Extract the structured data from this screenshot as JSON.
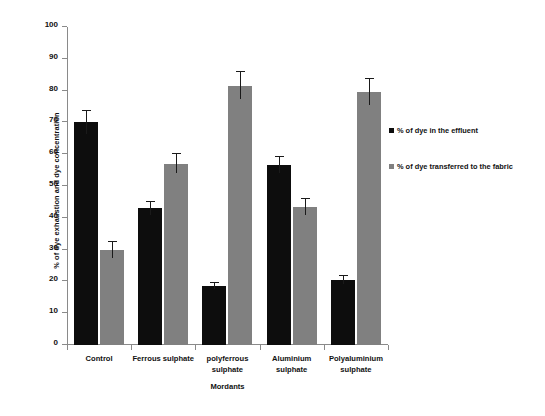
{
  "chart_data": {
    "type": "bar",
    "title": "",
    "xlabel": "Mordants",
    "ylabel": "% of dye exhaustion and dye concentration",
    "ylim": [
      0,
      100
    ],
    "ytick_step": 10,
    "yticks": [
      "100",
      "90",
      "80",
      "70",
      "60",
      "50",
      "40",
      "30",
      "20",
      "10",
      "0"
    ],
    "grid": false,
    "legend_position": "right",
    "categories": [
      "Control",
      "Ferrous sulphate",
      "polyferrous sulphate",
      "Aluminium sulphate",
      "Polyaluminium sulphate"
    ],
    "category_lines": [
      [
        "Control"
      ],
      [
        "Ferrous sulphate"
      ],
      [
        "polyferrous",
        "sulphate"
      ],
      [
        "Aluminium",
        "sulphate"
      ],
      [
        "Polyaluminium",
        "sulphate"
      ]
    ],
    "series": [
      {
        "name": "% of dye in the effluent",
        "color": "#0d0d0d",
        "values": [
          70.0,
          43.0,
          18.5,
          56.5,
          20.5
        ],
        "errors": [
          3.5,
          2.0,
          1.0,
          2.5,
          1.3
        ]
      },
      {
        "name": "% of dye transferred to the fabric",
        "color": "#808080",
        "values": [
          30.0,
          57.0,
          81.5,
          43.5,
          79.5
        ],
        "errors": [
          2.5,
          3.0,
          4.2,
          2.5,
          4.0
        ]
      }
    ]
  },
  "legend": {
    "items": [
      {
        "label": "% of dye in the effluent",
        "color": "#0d0d0d"
      },
      {
        "label": "% of dye transferred to the fabric",
        "color": "#808080"
      }
    ]
  },
  "axes": {
    "y_title": "% of dye exhaustion and dye concentration",
    "x_title": "Mordants"
  }
}
